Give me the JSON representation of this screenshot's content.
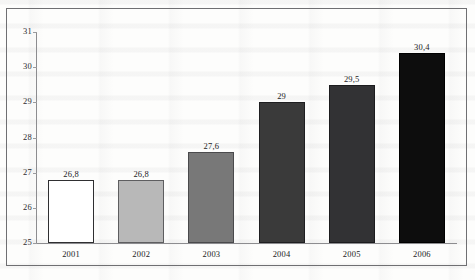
{
  "figure": {
    "frame_color": "#6f6f72",
    "background_color": "#fdfdfc",
    "axis_color": "#8c8c8f"
  },
  "chart_data": {
    "type": "bar",
    "title": "",
    "subtitle": "",
    "xlabel": "",
    "ylabel": "",
    "categories": [
      "2001",
      "2002",
      "2003",
      "2004",
      "2005",
      "2006"
    ],
    "values": [
      26.8,
      26.8,
      27.6,
      29,
      29.5,
      30.4
    ],
    "value_labels": [
      "26,8",
      "26,8",
      "27,6",
      "29",
      "29,5",
      "30,4"
    ],
    "decimal_separator": ",",
    "ylim": [
      25,
      31
    ],
    "yticks": [
      25,
      26,
      27,
      28,
      29,
      30,
      31
    ],
    "ytick_labels": [
      "25",
      "26",
      "27",
      "28",
      "29",
      "30",
      "31"
    ],
    "grid": false,
    "legend": false,
    "legend_position": "none",
    "orientation": "vertical",
    "bar_colors": [
      "#ffffff",
      "#b8b8b8",
      "#787878",
      "#3a3a3a",
      "#323234",
      "#0d0d0d"
    ],
    "bar_edge_colors": [
      "#2f2f31",
      "#5e5e60",
      "#4a4a4c",
      "#1f1f21",
      "#1c1c1e",
      "#000000"
    ]
  }
}
